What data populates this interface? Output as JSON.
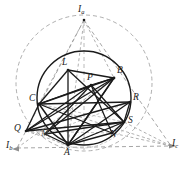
{
  "figure": {
    "width": 189,
    "height": 178,
    "background_color": "#ffffff",
    "stroke_color": "#1a1a1a",
    "dashed_color": "#8c8c8c",
    "faint_color": "#a6a6a6"
  },
  "labels": {
    "Ia": {
      "text": "I",
      "sub": "a"
    },
    "Ib": {
      "text": "I",
      "sub": "b"
    },
    "Ic": {
      "text": "I",
      "sub": "c"
    },
    "A": {
      "text": "A"
    },
    "B": {
      "text": "B"
    },
    "C": {
      "text": "C"
    },
    "L": {
      "text": "L"
    },
    "P": {
      "text": "P"
    },
    "M": {
      "text": "M"
    },
    "N": {
      "text": "N"
    },
    "Q": {
      "text": "Q"
    },
    "R": {
      "text": "R"
    },
    "S": {
      "text": "S"
    }
  },
  "geometry": {
    "circumcircle": {
      "cx": 84,
      "cy": 98,
      "r": 47,
      "style": "solid"
    },
    "excircle_dashed": {
      "cx": 84,
      "cy": 83,
      "r": 68,
      "style": "dashed"
    },
    "points": {
      "Ia": {
        "x": 84,
        "y": 20
      },
      "Ib": {
        "x": 17,
        "y": 148
      },
      "Ic": {
        "x": 171,
        "y": 146
      },
      "A": {
        "x": 68,
        "y": 145
      },
      "B": {
        "x": 114,
        "y": 78
      },
      "C": {
        "x": 39,
        "y": 104
      },
      "L": {
        "x": 68,
        "y": 70
      },
      "P": {
        "x": 91,
        "y": 85
      },
      "M": {
        "x": 45,
        "y": 134
      },
      "N": {
        "x": 112,
        "y": 133
      },
      "Q": {
        "x": 26,
        "y": 131
      },
      "R": {
        "x": 130,
        "y": 102
      },
      "S": {
        "x": 124,
        "y": 122
      }
    }
  }
}
